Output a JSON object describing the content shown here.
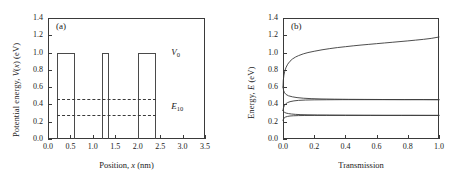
{
  "figure": {
    "panels": [
      {
        "tag": "(a)",
        "xlabel_html": "Position, x (nm)",
        "ylabel_html": "Potential energy, V(x) (eV)",
        "xticks": [
          "0.0",
          "0.5",
          "1.0",
          "1.5",
          "2.0",
          "2.5",
          "3.0",
          "3.5"
        ],
        "yticks": [
          "0.0",
          "0.2",
          "0.4",
          "0.6",
          "0.8",
          "1.0",
          "1.2",
          "1.4"
        ],
        "annotations": [
          {
            "name": "barrier-height-label",
            "text": "V",
            "sub": "0"
          },
          {
            "name": "energy-level-label",
            "text": "E",
            "sub": "10"
          }
        ]
      },
      {
        "tag": "(b)",
        "xlabel_html": "Transmission",
        "ylabel_html": "Energy, E (eV)",
        "xticks": [
          "0.0",
          "0.2",
          "0.4",
          "0.6",
          "0.8",
          "1.0"
        ],
        "yticks": [
          "0.0",
          "0.2",
          "0.4",
          "0.6",
          "0.8",
          "1.0",
          "1.2",
          "1.4"
        ]
      }
    ]
  },
  "chart_data": [
    {
      "type": "area",
      "panel": "(a)",
      "title": "Triple rectangular barrier potential profile",
      "xlabel": "Position, x (nm)",
      "ylabel": "Potential energy, V(x) (eV)",
      "xlim": [
        0.0,
        3.5
      ],
      "ylim": [
        0.0,
        1.4
      ],
      "xtick_values": [
        0.0,
        0.5,
        1.0,
        1.5,
        2.0,
        2.5,
        3.0,
        3.5
      ],
      "ytick_values": [
        0.0,
        0.2,
        0.4,
        0.6,
        0.8,
        1.0,
        1.2,
        1.4
      ],
      "grid": false,
      "legend": "none",
      "barrier_height_eV": 1.0,
      "barriers": [
        {
          "x_start": 0.2,
          "x_end": 0.6,
          "height": 1.0
        },
        {
          "x_start": 1.2,
          "x_end": 1.37,
          "height": 1.0
        },
        {
          "x_start": 2.0,
          "x_end": 2.4,
          "height": 1.0
        }
      ],
      "energy_levels": [
        {
          "label": "E10 upper",
          "energy": 0.46,
          "style": "dashed",
          "x_start": 0.2,
          "x_end": 2.4
        },
        {
          "label": "E10 lower",
          "energy": 0.28,
          "style": "dashed",
          "x_start": 0.2,
          "x_end": 2.4
        }
      ],
      "annotations": [
        {
          "text": "V0",
          "x": 2.75,
          "y": 1.0
        },
        {
          "text": "E10",
          "x": 2.75,
          "y": 0.37
        }
      ]
    },
    {
      "type": "line",
      "panel": "(b)",
      "title": "Transmission coefficient versus energy",
      "xlabel": "Transmission",
      "ylabel": "Energy, E (eV)",
      "xlim": [
        0.0,
        1.0
      ],
      "ylim": [
        0.0,
        1.4
      ],
      "xtick_values": [
        0.0,
        0.2,
        0.4,
        0.6,
        0.8,
        1.0
      ],
      "ytick_values": [
        0.0,
        0.2,
        0.4,
        0.6,
        0.8,
        1.0,
        1.2,
        1.4
      ],
      "grid": false,
      "legend": "none",
      "description": "Transmission on horizontal axis, energy on vertical axis. Two sharp resonances below the barrier at E = 0.28 eV and E = 0.46 eV reach T = 1, plus an above-barrier branch rising from about 0.75 eV to 1.18 eV.",
      "series": [
        {
          "name": "above-barrier branch",
          "points": [
            [
              0.0,
              0.6
            ],
            [
              0.002,
              0.68
            ],
            [
              0.006,
              0.74
            ],
            [
              0.012,
              0.79
            ],
            [
              0.02,
              0.83
            ],
            [
              0.03,
              0.865
            ],
            [
              0.045,
              0.9
            ],
            [
              0.06,
              0.925
            ],
            [
              0.08,
              0.948
            ],
            [
              0.1,
              0.965
            ],
            [
              0.13,
              0.985
            ],
            [
              0.16,
              1.0
            ],
            [
              0.2,
              1.015
            ],
            [
              0.25,
              1.032
            ],
            [
              0.3,
              1.046
            ],
            [
              0.35,
              1.058
            ],
            [
              0.4,
              1.068
            ],
            [
              0.45,
              1.078
            ],
            [
              0.5,
              1.087
            ],
            [
              0.55,
              1.095
            ],
            [
              0.6,
              1.103
            ],
            [
              0.65,
              1.111
            ],
            [
              0.7,
              1.119
            ],
            [
              0.75,
              1.127
            ],
            [
              0.8,
              1.135
            ],
            [
              0.85,
              1.144
            ],
            [
              0.9,
              1.153
            ],
            [
              0.95,
              1.164
            ],
            [
              1.0,
              1.18
            ]
          ]
        },
        {
          "name": "resonance 2 lower lobe",
          "points": [
            [
              0.0,
              0.6
            ],
            [
              0.004,
              0.56
            ],
            [
              0.01,
              0.535
            ],
            [
              0.02,
              0.515
            ],
            [
              0.035,
              0.5
            ],
            [
              0.06,
              0.488
            ],
            [
              0.09,
              0.479
            ],
            [
              0.13,
              0.472
            ],
            [
              0.18,
              0.467
            ],
            [
              0.25,
              0.463
            ],
            [
              0.33,
              0.461
            ],
            [
              0.42,
              0.459
            ],
            [
              0.52,
              0.458
            ],
            [
              0.64,
              0.457
            ],
            [
              0.78,
              0.456
            ],
            [
              0.9,
              0.456
            ],
            [
              1.0,
              0.455
            ]
          ]
        },
        {
          "name": "resonance 2 upper lobe",
          "points": [
            [
              0.0,
              0.33
            ],
            [
              0.003,
              0.36
            ],
            [
              0.008,
              0.385
            ],
            [
              0.016,
              0.405
            ],
            [
              0.028,
              0.42
            ],
            [
              0.045,
              0.432
            ],
            [
              0.07,
              0.441
            ],
            [
              0.1,
              0.447
            ],
            [
              0.145,
              0.451
            ],
            [
              0.2,
              0.453
            ],
            [
              0.28,
              0.454
            ],
            [
              0.38,
              0.455
            ],
            [
              0.5,
              0.455
            ],
            [
              0.65,
              0.455
            ],
            [
              0.82,
              0.455
            ],
            [
              1.0,
              0.455
            ]
          ]
        },
        {
          "name": "resonance 1 lower lobe",
          "points": [
            [
              0.0,
              0.33
            ],
            [
              0.004,
              0.318
            ],
            [
              0.01,
              0.308
            ],
            [
              0.02,
              0.3
            ],
            [
              0.035,
              0.294
            ],
            [
              0.055,
              0.289
            ],
            [
              0.08,
              0.285
            ],
            [
              0.115,
              0.282
            ],
            [
              0.16,
              0.28
            ],
            [
              0.22,
              0.278
            ],
            [
              0.3,
              0.277
            ],
            [
              0.4,
              0.276
            ],
            [
              0.52,
              0.275
            ],
            [
              0.66,
              0.274
            ],
            [
              0.82,
              0.274
            ],
            [
              1.0,
              0.273
            ]
          ]
        },
        {
          "name": "resonance 1 upper lobe",
          "points": [
            [
              0.0,
              0.215
            ],
            [
              0.003,
              0.232
            ],
            [
              0.008,
              0.245
            ],
            [
              0.016,
              0.254
            ],
            [
              0.028,
              0.261
            ],
            [
              0.045,
              0.266
            ],
            [
              0.068,
              0.269
            ],
            [
              0.1,
              0.271
            ],
            [
              0.14,
              0.272
            ],
            [
              0.2,
              0.273
            ],
            [
              0.28,
              0.273
            ],
            [
              0.4,
              0.273
            ],
            [
              0.56,
              0.273
            ],
            [
              0.76,
              0.273
            ],
            [
              1.0,
              0.273
            ]
          ]
        }
      ]
    }
  ]
}
